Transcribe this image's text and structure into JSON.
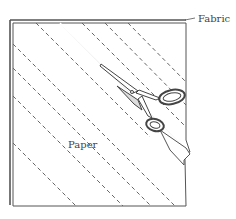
{
  "figure": {
    "labels": {
      "fabric": "Fabric",
      "paper": "Paper"
    },
    "colors": {
      "line": "#555555",
      "dash": "#666666",
      "background": "#ffffff"
    },
    "elements": [
      "fabric-square",
      "paper-layer",
      "diagonal-dashed-cut-lines",
      "scissors",
      "cut-strip"
    ]
  }
}
